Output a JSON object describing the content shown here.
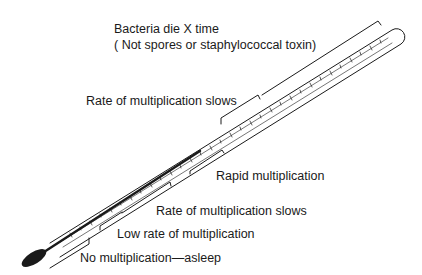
{
  "diagram": {
    "ink_color": "#1a1a1a",
    "background": "#ffffff",
    "zones": [
      {
        "id": "die",
        "line1": "Bacteria die X time",
        "line2": "( Not spores or staphylococcal toxin)"
      },
      {
        "id": "slows-high",
        "label": "Rate of multiplication slows"
      },
      {
        "id": "rapid",
        "label": "Rapid multiplication"
      },
      {
        "id": "slows-low",
        "label": "Rate of multiplication slows"
      },
      {
        "id": "low",
        "label": "Low rate of multiplication"
      },
      {
        "id": "none",
        "label": "No multiplication—asleep"
      }
    ]
  }
}
